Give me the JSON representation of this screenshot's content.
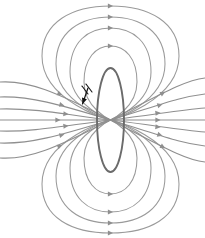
{
  "figure": {
    "width": 205,
    "height": 238,
    "background_color": "#ffffff"
  },
  "colors": {
    "field_line": "#8f8f8f",
    "field_line_inner": "#9a9a9a",
    "loop_outline": "#6b6b6b",
    "current_arrow": "#111111",
    "background": "#ffffff"
  },
  "loop": {
    "name": "current-loop",
    "shape": "ellipse",
    "center_x": 110.5,
    "center_y": 120,
    "radius_x": 13.5,
    "radius_y": 52,
    "stroke_width": 1.9
  },
  "current_indicator": {
    "name": "current-direction-arrow",
    "label": "I",
    "direction": "down-left",
    "arrow_start_x": 88,
    "arrow_start_y": 88,
    "arrow_end_x": 82.5,
    "arrow_end_y": 104,
    "tick_count": 2
  },
  "chart_data": {
    "type": "line",
    "xlabel": "",
    "ylabel": "",
    "xlim": [
      0,
      205
    ],
    "ylim": [
      0,
      238
    ],
    "grid": false,
    "legend": "none",
    "arrow_direction": "rightward",
    "series": [
      {
        "name": "closed-loop-top-1",
        "group": "upper-closed-lines",
        "path": "M 110.5 120 C 110.5 120, 84 108, 84 82 C 84 58, 96 46, 110.5 46 C 125 46, 137 58, 137 82 C 137 108, 110.5 120, 110.5 120",
        "arrow_at": {
          "x": 110.5,
          "y": 46,
          "angle": 0
        }
      },
      {
        "name": "closed-loop-top-2",
        "group": "upper-closed-lines",
        "path": "M 110.5 120 C 110.5 120, 70 106, 70 72 C 70 42, 88 28, 110.5 28 C 133 28, 151 42, 151 72 C 151 106, 110.5 120, 110.5 120",
        "arrow_at": {
          "x": 110.5,
          "y": 28,
          "angle": 0
        }
      },
      {
        "name": "closed-loop-top-3",
        "group": "upper-closed-lines",
        "path": "M 110.5 120 C 110.5 120, 56 104, 56 64 C 56 32, 80 17, 110.5 17 C 141 17, 165 32, 165 64 C 165 104, 110.5 120, 110.5 120",
        "arrow_at": {
          "x": 110.5,
          "y": 17,
          "angle": 0
        }
      },
      {
        "name": "closed-loop-top-4",
        "group": "upper-closed-lines",
        "path": "M 110.5 120 C 110.5 120, 42 102, 42 56 C 42 22, 72 6, 110.5 6 C 149 6, 179 22, 179 56 C 179 102, 110.5 120, 110.5 120",
        "arrow_at": {
          "x": 110.5,
          "y": 6,
          "angle": 0
        }
      },
      {
        "name": "closed-loop-bottom-1",
        "group": "lower-closed-lines",
        "path": "M 110.5 120 C 110.5 120, 84 132, 84 158 C 84 182, 96 194, 110.5 194 C 125 194, 137 182, 137 158 C 137 132, 110.5 120, 110.5 120",
        "arrow_at": {
          "x": 110.5,
          "y": 194,
          "angle": 0
        }
      },
      {
        "name": "closed-loop-bottom-2",
        "group": "lower-closed-lines",
        "path": "M 110.5 120 C 110.5 120, 70 134, 70 168 C 70 198, 88 212, 110.5 212 C 133 212, 151 198, 151 168 C 151 134, 110.5 120, 110.5 120",
        "arrow_at": {
          "x": 110.5,
          "y": 212,
          "angle": 0
        }
      },
      {
        "name": "closed-loop-bottom-3",
        "group": "lower-closed-lines",
        "path": "M 110.5 120 C 110.5 120, 56 136, 56 176 C 56 208, 80 223, 110.5 223 C 141 223, 165 208, 165 176 C 165 136, 110.5 120, 110.5 120",
        "arrow_at": {
          "x": 110.5,
          "y": 223,
          "angle": 0
        }
      },
      {
        "name": "closed-loop-bottom-4",
        "group": "lower-closed-lines",
        "path": "M 110.5 120 C 110.5 120, 42 138, 42 184 C 42 218, 72 233, 110.5 233 C 149 233, 179 218, 179 184 C 179 138, 110.5 120, 110.5 120",
        "arrow_at": {
          "x": 110.5,
          "y": 233,
          "angle": 0
        }
      },
      {
        "name": "open-line-upper-3",
        "group": "open-lines",
        "path": "M 0 82 C 28 80, 56 92, 110.5 120 C 165 148, 186 160, 205 162",
        "arrow_at": {
          "x": 60,
          "y": 94,
          "angle": 22
        },
        "arrow_at_2": {
          "x": 163,
          "y": 147,
          "angle": 28
        }
      },
      {
        "name": "open-line-upper-2",
        "group": "open-lines",
        "path": "M 0 97 C 30 96, 58 104, 110.5 120 C 163 136, 180 143, 205 146",
        "arrow_at": {
          "x": 62,
          "y": 105,
          "angle": 14
        },
        "arrow_at_2": {
          "x": 160,
          "y": 135,
          "angle": 17
        }
      },
      {
        "name": "open-line-upper-1",
        "group": "open-lines",
        "path": "M 0 109 C 32 108, 62 114, 110.5 120 C 159 126, 180 130, 205 132",
        "arrow_at": {
          "x": 66,
          "y": 114,
          "angle": 6
        },
        "arrow_at_2": {
          "x": 158,
          "y": 127,
          "angle": 7
        }
      },
      {
        "name": "open-line-center",
        "group": "open-lines",
        "path": "M 0 120 L 205 120",
        "arrow_at": {
          "x": 58,
          "y": 120,
          "angle": 0
        },
        "arrow_at_2": {
          "x": 158,
          "y": 120,
          "angle": 0
        }
      },
      {
        "name": "open-line-lower-1",
        "group": "open-lines",
        "path": "M 0 131 C 32 132, 62 126, 110.5 120 C 159 114, 180 110, 205 108",
        "arrow_at": {
          "x": 66,
          "y": 126,
          "angle": -6
        },
        "arrow_at_2": {
          "x": 158,
          "y": 113,
          "angle": -7
        }
      },
      {
        "name": "open-line-lower-2",
        "group": "open-lines",
        "path": "M 0 143 C 30 144, 58 136, 110.5 120 C 163 104, 180 97, 205 94",
        "arrow_at": {
          "x": 62,
          "y": 135,
          "angle": -14
        },
        "arrow_at_2": {
          "x": 160,
          "y": 105,
          "angle": -17
        }
      },
      {
        "name": "open-line-lower-3",
        "group": "open-lines",
        "path": "M 0 158 C 28 160, 56 148, 110.5 120 C 165 92, 186 80, 205 78",
        "arrow_at": {
          "x": 60,
          "y": 146,
          "angle": -22
        },
        "arrow_at_2": {
          "x": 163,
          "y": 93,
          "angle": -28
        }
      }
    ]
  }
}
